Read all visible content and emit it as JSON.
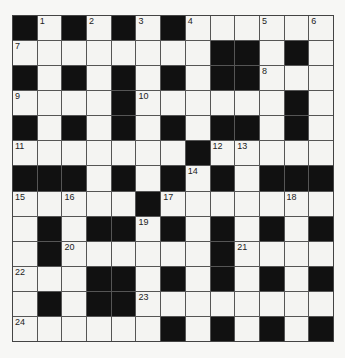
{
  "puzzle": {
    "type": "crossword",
    "rows": 13,
    "cols": 13,
    "colors": {
      "block": "#111111",
      "cell": "#f4f4f2",
      "line": "#555555"
    },
    "grid": [
      [
        "#",
        "1",
        "#",
        "2",
        "#",
        "3",
        "#",
        "4",
        ".",
        ".",
        "5",
        ".",
        "6"
      ],
      [
        "7",
        ".",
        ".",
        ".",
        ".",
        ".",
        ".",
        ".",
        "#",
        "#",
        ".",
        "#",
        "."
      ],
      [
        "#",
        ".",
        "#",
        ".",
        "#",
        ".",
        "#",
        ".",
        "#",
        "#",
        "8",
        ".",
        "."
      ],
      [
        "9",
        ".",
        ".",
        ".",
        "#",
        "10",
        ".",
        ".",
        ".",
        ".",
        ".",
        "#",
        "."
      ],
      [
        "#",
        ".",
        "#",
        ".",
        "#",
        ".",
        "#",
        ".",
        "#",
        "#",
        ".",
        "#",
        "."
      ],
      [
        "11",
        ".",
        ".",
        ".",
        ".",
        ".",
        ".",
        "#",
        "12",
        "13",
        ".",
        ".",
        "."
      ],
      [
        "#",
        "#",
        "#",
        ".",
        "#",
        ".",
        "#",
        "14",
        "#",
        ".",
        "#",
        "#",
        "#"
      ],
      [
        "15",
        ".",
        "16",
        ".",
        ".",
        "#",
        "17",
        ".",
        ".",
        ".",
        ".",
        "18",
        "."
      ],
      [
        ".",
        "#",
        ".",
        "#",
        "#",
        "19",
        "#",
        ".",
        "#",
        ".",
        "#",
        ".",
        "#"
      ],
      [
        ".",
        "#",
        "20",
        ".",
        ".",
        ".",
        ".",
        ".",
        "#",
        "21",
        ".",
        ".",
        "."
      ],
      [
        "22",
        ".",
        ".",
        "#",
        "#",
        ".",
        "#",
        ".",
        "#",
        ".",
        "#",
        ".",
        "#"
      ],
      [
        ".",
        "#",
        ".",
        "#",
        "#",
        "23",
        ".",
        ".",
        ".",
        ".",
        ".",
        ".",
        "."
      ],
      [
        "24",
        ".",
        ".",
        ".",
        ".",
        ".",
        "#",
        ".",
        "#",
        ".",
        "#",
        ".",
        "#"
      ]
    ]
  }
}
